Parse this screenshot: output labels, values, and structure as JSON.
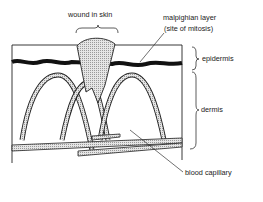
{
  "diagram": {
    "labels": {
      "wound": "wound in skin",
      "malpighian_line1": "malpighian layer",
      "malpighian_line2": "(site of mitosis)",
      "epidermis": "epidermis",
      "dermis": "dermis",
      "capillary": "blood capillary"
    },
    "colors": {
      "stroke": "#222222",
      "fill_stipple": "#cfcfcf",
      "background": "#ffffff"
    }
  }
}
